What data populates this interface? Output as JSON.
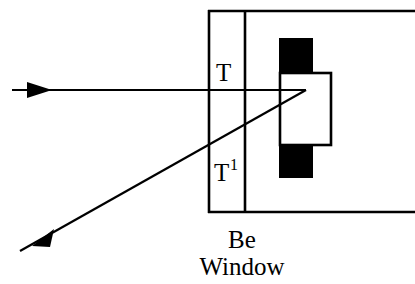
{
  "figure": {
    "kind": "optics-beam-schematic",
    "background_color": "#ffffff",
    "ink_color": "#000000",
    "width": 415,
    "height": 284
  },
  "labels": {
    "transmitted_ray": "T",
    "deflected_ray_base": "T",
    "deflected_ray_superscript": "1",
    "window_line1": "Be",
    "window_line2": "Window"
  },
  "elements": {
    "window_name": "Be Window",
    "chamber_top_line": "chamber-top-wall",
    "chamber_bottom_line": "chamber-bottom-wall",
    "window_left_edge": "be-window-left-edge",
    "window_right_edge": "be-window-right-edge",
    "detector_block": "detector-black-block",
    "detector_aperture": "detector-white-aperture",
    "incoming_beam": "incoming-beam-arrow",
    "outgoing_beam": "outgoing-deflected-beam-arrow"
  },
  "geometry": {
    "top_wall_y": 11,
    "bottom_wall_y": 212,
    "window_left_x": 208,
    "window_right_x": 246,
    "horizontal_ray_y": 90,
    "horizontal_ray_start_x": 12,
    "convergence_point_x": 306,
    "convergence_point_y": 90,
    "diagonal_end_x": 20,
    "diagonal_end_y": 251,
    "black_block_x": 279,
    "black_block_y": 38,
    "black_block_width": 34,
    "black_block_height": 140,
    "white_rect_x": 280,
    "white_rect_y": 73,
    "white_rect_width": 51,
    "white_rect_height": 72
  }
}
